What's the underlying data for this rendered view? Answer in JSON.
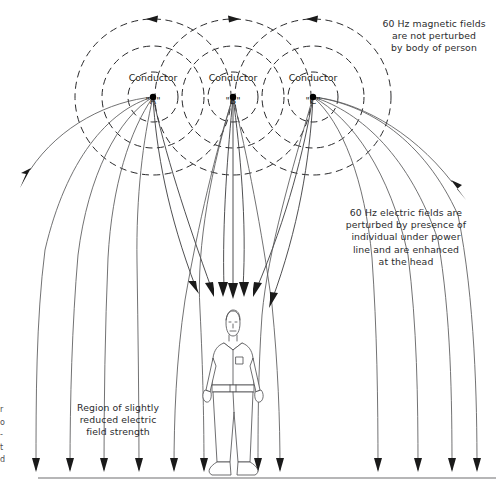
{
  "figure": {
    "type": "technical-illustration"
  },
  "conductors": [
    {
      "id": "A",
      "name_line1": "Conductor",
      "name_line2": "\"A\"",
      "x": 153,
      "y": 97
    },
    {
      "id": "B",
      "name_line1": "Conductor",
      "name_line2": "\"B\"",
      "x": 233,
      "y": 97
    },
    {
      "id": "C",
      "name_line1": "Conductor",
      "name_line2": "\"C\"",
      "x": 313,
      "y": 97
    }
  ],
  "annotations": {
    "magnetic": "60 Hz magnetic fields\nare not perturbed\nby body of person",
    "electric": "60 Hz electric fields are\nperturbed by presence of\nindividual under power\nline and are enhanced\nat the head",
    "region": "Region of slightly\nreduced electric\nfield strength"
  },
  "margin_crop": {
    "chars": [
      "r",
      "o",
      "-",
      "t",
      "d"
    ]
  },
  "colors": {
    "background": "#ffffff",
    "magnetic_field_stroke": "#2a2a2c",
    "electric_field_stroke": "#58585a",
    "ground_stroke": "#6e6e70",
    "text": "#2b2b2d",
    "conductor_dot": "#000000"
  },
  "ground": {
    "y": 478,
    "x_start": 38,
    "x_end": 496
  }
}
